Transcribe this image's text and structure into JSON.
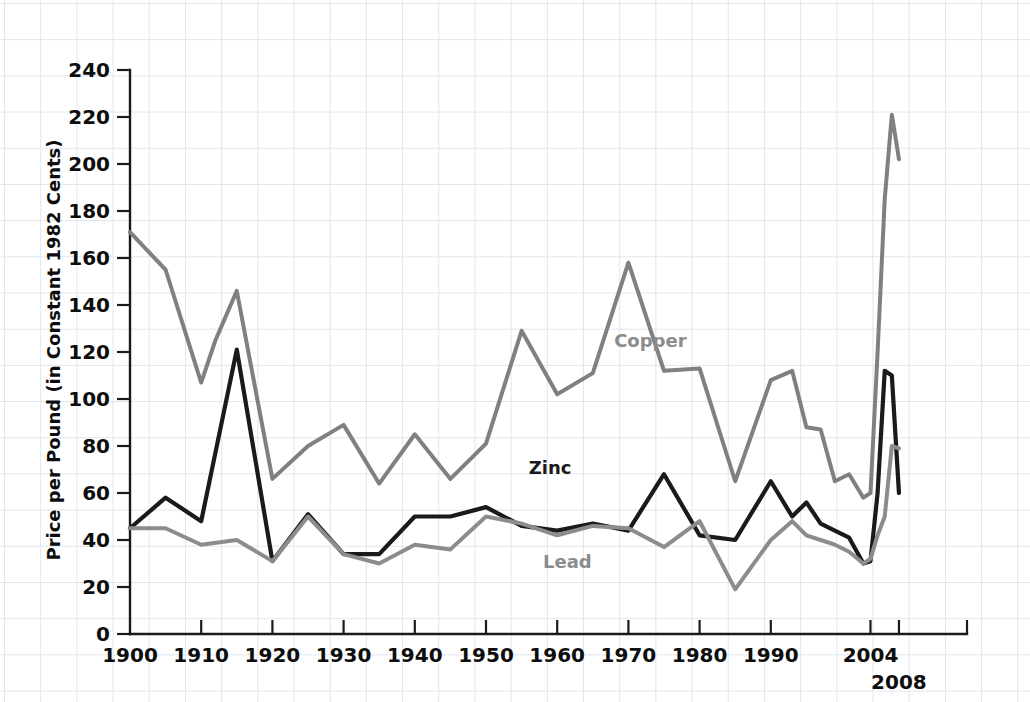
{
  "chart_data": {
    "type": "line",
    "title": "",
    "xlabel": "",
    "ylabel": "Price per Pound (in Constant 1982 Cents)",
    "xlim": [
      1900,
      2008
    ],
    "ylim": [
      0,
      240
    ],
    "grid": true,
    "legend_position": "inline-annotations",
    "y_ticks": [
      0,
      20,
      40,
      60,
      80,
      100,
      120,
      140,
      160,
      180,
      200,
      220,
      240
    ],
    "y_tick_labels": [
      "0",
      "20",
      "40",
      "60",
      "80",
      "100",
      "120",
      "140",
      "160",
      "180",
      "200",
      "220",
      "240"
    ],
    "x_ticks": [
      1900,
      1910,
      1920,
      1930,
      1940,
      1950,
      1960,
      1970,
      1980,
      1990,
      2004,
      2008
    ],
    "x_tick_labels": [
      "1900",
      "1910",
      "1920",
      "1930",
      "1940",
      "1950",
      "1960",
      "1970",
      "1980",
      "1990",
      "2004",
      "2008"
    ],
    "colors": {
      "copper": "#808080",
      "zinc": "#1a1a1a",
      "lead": "#8c8c8c",
      "axis": "#1a1a1a",
      "grid": "#dfe6ef",
      "background": "#ffffff"
    },
    "series": [
      {
        "name": "Copper",
        "color": "#808080",
        "x": [
          1900,
          1905,
          1910,
          1912,
          1915,
          1920,
          1925,
          1930,
          1935,
          1940,
          1945,
          1950,
          1955,
          1960,
          1965,
          1970,
          1975,
          1980,
          1985,
          1990,
          1993,
          1995,
          1997,
          1999,
          2001,
          2003,
          2004,
          2005,
          2006,
          2007,
          2008
        ],
        "values": [
          171,
          155,
          107,
          125,
          146,
          66,
          80,
          89,
          64,
          85,
          66,
          81,
          129,
          102,
          111,
          158,
          112,
          113,
          65,
          108,
          112,
          88,
          87,
          65,
          68,
          58,
          60,
          120,
          185,
          221,
          202
        ]
      },
      {
        "name": "Zinc",
        "color": "#1a1a1a",
        "x": [
          1900,
          1905,
          1910,
          1915,
          1920,
          1925,
          1930,
          1935,
          1940,
          1945,
          1950,
          1955,
          1960,
          1965,
          1970,
          1975,
          1980,
          1985,
          1990,
          1993,
          1995,
          1997,
          1999,
          2001,
          2003,
          2004,
          2005,
          2006,
          2007,
          2008
        ],
        "values": [
          45,
          58,
          48,
          121,
          31,
          51,
          34,
          34,
          50,
          50,
          54,
          46,
          44,
          47,
          44,
          68,
          42,
          40,
          65,
          50,
          56,
          47,
          44,
          41,
          30,
          31,
          60,
          112,
          110,
          60
        ]
      },
      {
        "name": "Lead",
        "color": "#8c8c8c",
        "x": [
          1900,
          1905,
          1910,
          1915,
          1920,
          1925,
          1930,
          1935,
          1940,
          1945,
          1950,
          1955,
          1960,
          1965,
          1970,
          1975,
          1980,
          1985,
          1990,
          1993,
          1995,
          1997,
          1999,
          2001,
          2003,
          2004,
          2005,
          2006,
          2007,
          2008
        ],
        "values": [
          45,
          45,
          38,
          40,
          31,
          50,
          34,
          30,
          38,
          36,
          50,
          47,
          42,
          46,
          45,
          37,
          48,
          19,
          40,
          48,
          42,
          40,
          38,
          35,
          30,
          32,
          42,
          50,
          80,
          79
        ]
      }
    ],
    "annotations": [
      {
        "label": "Copper",
        "x": 1968,
        "y": 122,
        "color": "#8c8c8c"
      },
      {
        "label": "Zinc",
        "x": 1956,
        "y": 68,
        "color": "#1a1a1a"
      },
      {
        "label": "Lead",
        "x": 1958,
        "y": 28,
        "color": "#8c8c8c"
      }
    ]
  }
}
